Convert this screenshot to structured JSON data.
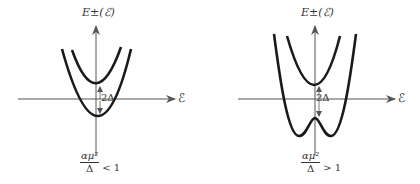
{
  "panels": [
    {
      "id": "left",
      "y_axis_label": "E±(ℰ)",
      "x_axis_label": "ℰ",
      "gap_label": "2Δ",
      "condition": {
        "numerator": "αμ²",
        "denominator": "Δ",
        "relation": "< 1"
      },
      "description": "Two parabolic bands separated by gap 2Δ; lower band has single minimum"
    },
    {
      "id": "right",
      "y_axis_label": "E±(ℰ)",
      "x_axis_label": "ℰ",
      "gap_label": "2Δ",
      "condition": {
        "numerator": "αμ²",
        "denominator": "Δ",
        "relation": "> 1"
      },
      "description": "Upper parabolic band; lower band is double-well (W-shaped) with two minima"
    }
  ],
  "colors": {
    "curve": "#1a1a1a",
    "axis": "#555555",
    "text": "#333333"
  }
}
